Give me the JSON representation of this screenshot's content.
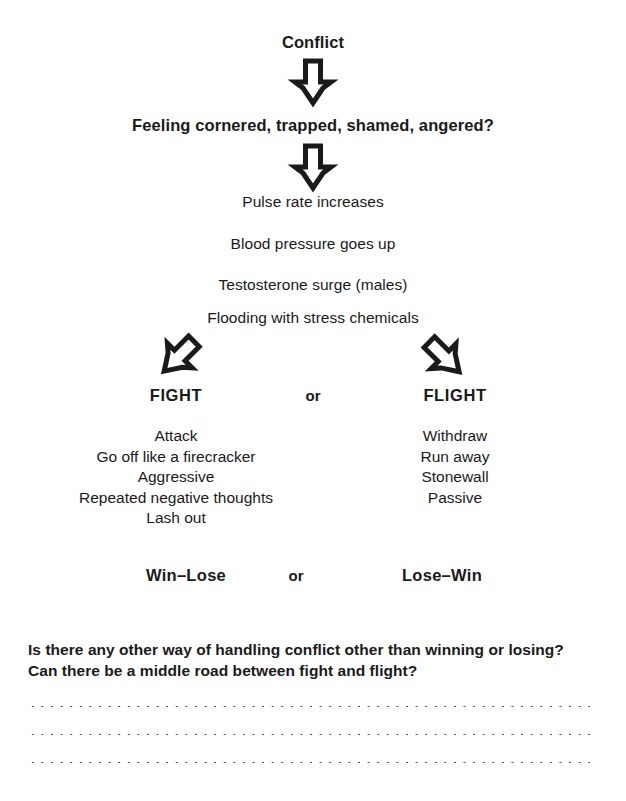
{
  "flow": {
    "title": "Conflict",
    "trigger_question": "Feeling cornered, trapped, shamed, angered?",
    "body_reactions": [
      "Pulse rate increases",
      "Blood pressure goes up",
      "Testosterone surge (males)",
      "Flooding with stress chemicals"
    ],
    "branches": {
      "connector": "or",
      "left": {
        "label": "FIGHT",
        "traits": [
          "Attack",
          "Go off like a firecracker",
          "Aggressive",
          "Repeated negative thoughts",
          "Lash out"
        ],
        "outcome": "Win–Lose"
      },
      "right": {
        "label": "FLIGHT",
        "traits": [
          "Withdraw",
          "Run away",
          "Stonewall",
          "Passive"
        ],
        "outcome": "Lose–Win"
      }
    },
    "outcome_connector": "or"
  },
  "worksheet": {
    "question_line_1": "Is there any other way of handling conflict other than winning or losing?",
    "question_line_2": "Can there be a middle road between fight and flight?",
    "answer_lines": 3
  },
  "style": {
    "ink": "#1a1a1a",
    "paper": "#ffffff",
    "dot_color": "#4a4a4a"
  }
}
